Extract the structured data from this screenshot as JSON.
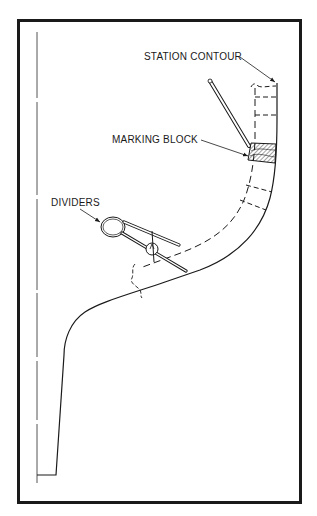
{
  "figure": {
    "type": "technical-illustration",
    "labels": {
      "station_contour": "STATION CONTOUR",
      "marking_block": "MARKING BLOCK",
      "dividers": "DIVIDERS"
    },
    "elements": [
      {
        "name": "frame-border",
        "description": "Heavy black rectangular frame"
      },
      {
        "name": "centerline",
        "description": "Thin vertical dash-dot centerline on the left"
      },
      {
        "name": "station-contour-outline",
        "description": "Solid curved hull section outline"
      },
      {
        "name": "offset-dashed-line",
        "description": "Dashed line parallel to contour"
      },
      {
        "name": "marking-block",
        "description": "Hatched block on contour"
      },
      {
        "name": "pencil",
        "description": "Pencil pointing to marking block"
      },
      {
        "name": "dividers",
        "description": "Spring dividers spanning between dashed line and contour"
      }
    ],
    "colors": {
      "line": "#1a1a1a",
      "background": "#ffffff",
      "centerline": "#555555"
    }
  }
}
